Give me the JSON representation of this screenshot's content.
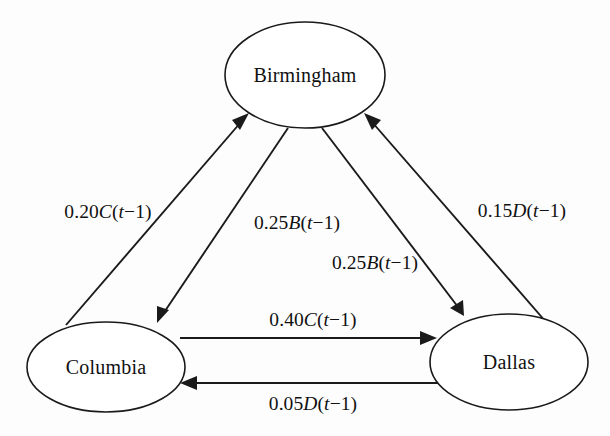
{
  "diagram": {
    "type": "directed-graph",
    "title": "",
    "background_color": "#fdfdfd",
    "line_color": "#1a1a1a",
    "nodes": [
      {
        "id": "birmingham",
        "label": "Birmingham",
        "cx": 305,
        "cy": 75,
        "rx": 80,
        "ry": 53
      },
      {
        "id": "columbia",
        "label": "Columbia",
        "cx": 106,
        "cy": 367,
        "rx": 79,
        "ry": 45
      },
      {
        "id": "dallas",
        "label": "Dallas",
        "cx": 509,
        "cy": 362,
        "rx": 79,
        "ry": 48
      }
    ],
    "edges": [
      {
        "id": "columbia-to-birmingham",
        "from": "columbia",
        "to": "birmingham",
        "label": "0.20C(t−1)",
        "coefficient": 0.2,
        "variable": "C",
        "lag": "t−1",
        "label_x": 108,
        "label_y": 212
      },
      {
        "id": "birmingham-to-columbia",
        "from": "birmingham",
        "to": "columbia",
        "label": "0.25B(t−1)",
        "coefficient": 0.25,
        "variable": "B",
        "lag": "t−1",
        "label_x": 297,
        "label_y": 223
      },
      {
        "id": "birmingham-to-dallas",
        "from": "birmingham",
        "to": "dallas",
        "label": "0.25B(t−1)",
        "coefficient": 0.25,
        "variable": "B",
        "lag": "t−1",
        "label_y": 263,
        "label_x": 375
      },
      {
        "id": "dallas-to-birmingham",
        "from": "dallas",
        "to": "birmingham",
        "label": "0.15D(t−1)",
        "coefficient": 0.15,
        "variable": "D",
        "lag": "t−1",
        "label_x": 522,
        "label_y": 211
      },
      {
        "id": "columbia-to-dallas",
        "from": "columbia",
        "to": "dallas",
        "label": "0.40C(t−1)",
        "coefficient": 0.4,
        "variable": "C",
        "lag": "t−1",
        "label_x": 313,
        "label_y": 320
      },
      {
        "id": "dallas-to-columbia",
        "from": "dallas",
        "to": "columbia",
        "label": "0.05D(t−1)",
        "coefficient": 0.05,
        "variable": "D",
        "lag": "t−1",
        "label_x": 313,
        "label_y": 404
      }
    ]
  }
}
